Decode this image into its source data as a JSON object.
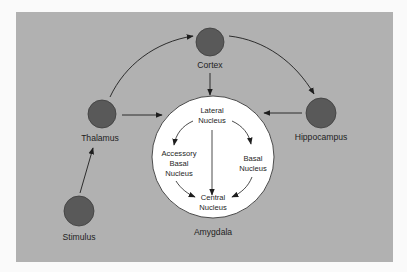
{
  "colors": {
    "page_bg": "#fafafa",
    "panel_bg": "#b1b1b1",
    "node_fill": "#595959",
    "node_stroke": "#3c3c3c",
    "amygdala_fill": "#ffffff",
    "amygdala_stroke": "#3a3a3a",
    "arrow": "#1e1e1e",
    "text": "#1e1e1e"
  },
  "nodes": {
    "cortex": {
      "label": "Cortex",
      "cx": 210,
      "cy": 42,
      "r": 14
    },
    "thalamus": {
      "label": "Thalamus",
      "cx": 102,
      "cy": 114,
      "r": 14
    },
    "hippocampus": {
      "label": "Hippocampus",
      "cx": 321,
      "cy": 113,
      "r": 15
    },
    "stimulus": {
      "label": "Stimulus",
      "cx": 79,
      "cy": 211,
      "r": 15
    }
  },
  "amygdala": {
    "label": "Amygdala",
    "cx": 213,
    "cy": 157,
    "r": 61,
    "nuclei": {
      "lateral": {
        "line1": "Lateral",
        "line2": "Nucleus"
      },
      "accessory_basal": {
        "line1": "Accessory",
        "line2": "Basal",
        "line3": "Nucleus"
      },
      "basal": {
        "line1": "Basal",
        "line2": "Nucleus"
      },
      "central": {
        "line1": "Central",
        "line2": "Nucleus"
      }
    }
  },
  "edges": [
    {
      "from": "Stimulus",
      "to": "Thalamus"
    },
    {
      "from": "Thalamus",
      "to": "Cortex"
    },
    {
      "from": "Thalamus",
      "to": "Amygdala"
    },
    {
      "from": "Cortex",
      "to": "Amygdala"
    },
    {
      "from": "Cortex",
      "to": "Hippocampus"
    },
    {
      "from": "Hippocampus",
      "to": "Amygdala"
    },
    {
      "from": "Lateral Nucleus",
      "to": "Accessory Basal Nucleus"
    },
    {
      "from": "Lateral Nucleus",
      "to": "Basal Nucleus"
    },
    {
      "from": "Lateral Nucleus",
      "to": "Central Nucleus"
    },
    {
      "from": "Accessory Basal Nucleus",
      "to": "Central Nucleus"
    },
    {
      "from": "Basal Nucleus",
      "to": "Central Nucleus"
    }
  ]
}
